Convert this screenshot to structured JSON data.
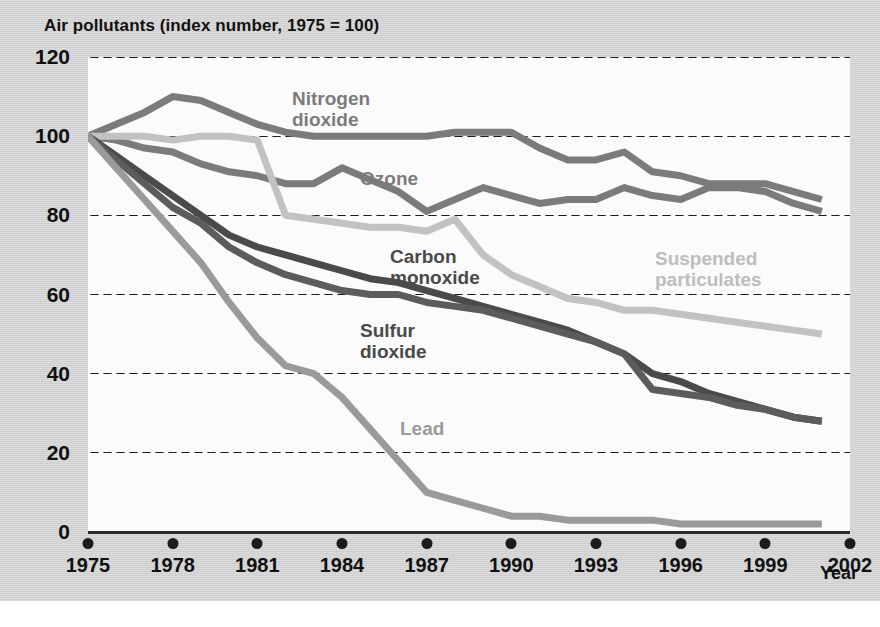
{
  "chart_title": "Air pollutants (index number, 1975 = 100)",
  "axes": {
    "x_axis_label": "Year",
    "y_ticks": [
      120,
      100,
      80,
      60,
      40,
      20,
      0
    ],
    "x_ticks": [
      1975,
      1978,
      1981,
      1984,
      1987,
      1990,
      1993,
      1996,
      1999,
      2002
    ]
  },
  "series_labels": [
    {
      "name": "nitrogen-dioxide",
      "text": "Nitrogen\ndioxide",
      "x": 292,
      "y": 88,
      "color": "#7b7b7b"
    },
    {
      "name": "ozone",
      "text": "Ozone",
      "x": 360,
      "y": 168,
      "color": "#7b7b7b"
    },
    {
      "name": "carbon-monoxide",
      "text": "Carbon\nmonoxide",
      "x": 390,
      "y": 246,
      "color": "#4a4a4a"
    },
    {
      "name": "suspended-particulates",
      "text": "Suspended\nparticulates",
      "x": 655,
      "y": 248,
      "color": "#bdbdbd"
    },
    {
      "name": "sulfur-dioxide",
      "text": "Sulfur\ndioxide",
      "x": 360,
      "y": 320,
      "color": "#4a4a4a"
    },
    {
      "name": "lead",
      "text": "Lead",
      "x": 400,
      "y": 418,
      "color": "#9a9a9a"
    }
  ],
  "colors": {
    "panel_background": "#d4d4d4",
    "plot_background": "#fbfbfb",
    "axis": "#1b1b1b",
    "nitrogen_dioxide": "#7b7b7b",
    "ozone": "#7b7b7b",
    "carbon_monoxide": "#4a4a4a",
    "sulfur_dioxide": "#5c5c5c",
    "suspended_particulates": "#c2c2c2",
    "lead": "#9a9a9a"
  },
  "chart_data": {
    "type": "line",
    "title": "Air pollutants (index number, 1975 = 100)",
    "xlabel": "Year",
    "ylabel": "",
    "xlim": [
      1975,
      2002
    ],
    "ylim": [
      0,
      120
    ],
    "grid": true,
    "legend": "inline-labels",
    "x": [
      1975,
      1976,
      1977,
      1978,
      1979,
      1980,
      1981,
      1982,
      1983,
      1984,
      1985,
      1986,
      1987,
      1988,
      1989,
      1990,
      1991,
      1992,
      1993,
      1994,
      1995,
      1996,
      1997,
      1998,
      1999,
      2000,
      2001
    ],
    "series": [
      {
        "name": "Nitrogen dioxide",
        "color": "#7b7b7b",
        "values": [
          100,
          103,
          106,
          110,
          109,
          106,
          103,
          101,
          100,
          100,
          100,
          100,
          100,
          101,
          101,
          101,
          97,
          94,
          94,
          96,
          91,
          90,
          88,
          88,
          88,
          86,
          84
        ]
      },
      {
        "name": "Ozone",
        "color": "#7b7b7b",
        "values": [
          100,
          99,
          97,
          96,
          93,
          91,
          90,
          88,
          88,
          92,
          89,
          86,
          81,
          84,
          87,
          85,
          83,
          84,
          84,
          87,
          85,
          84,
          87,
          87,
          86,
          83,
          81
        ]
      },
      {
        "name": "Suspended particulates",
        "color": "#c2c2c2",
        "values": [
          100,
          100,
          100,
          99,
          100,
          100,
          99,
          80,
          79,
          78,
          77,
          77,
          76,
          79,
          70,
          65,
          62,
          59,
          58,
          56,
          56,
          55,
          54,
          53,
          52,
          51,
          50
        ]
      },
      {
        "name": "Carbon monoxide",
        "color": "#4a4a4a",
        "values": [
          100,
          95,
          90,
          85,
          80,
          75,
          72,
          70,
          68,
          66,
          64,
          63,
          61,
          59,
          57,
          55,
          53,
          51,
          48,
          45,
          40,
          38,
          35,
          33,
          31,
          29,
          28
        ]
      },
      {
        "name": "Sulfur dioxide",
        "color": "#5c5c5c",
        "values": [
          100,
          94,
          88,
          82,
          78,
          72,
          68,
          65,
          63,
          61,
          60,
          60,
          58,
          57,
          56,
          54,
          52,
          50,
          48,
          45,
          36,
          35,
          34,
          32,
          31,
          29,
          28
        ]
      },
      {
        "name": "Lead",
        "color": "#9a9a9a",
        "values": [
          100,
          92,
          84,
          76,
          68,
          58,
          49,
          42,
          40,
          34,
          26,
          18,
          10,
          8,
          6,
          4,
          4,
          3,
          3,
          3,
          3,
          2,
          2,
          2,
          2,
          2,
          2
        ]
      }
    ]
  }
}
